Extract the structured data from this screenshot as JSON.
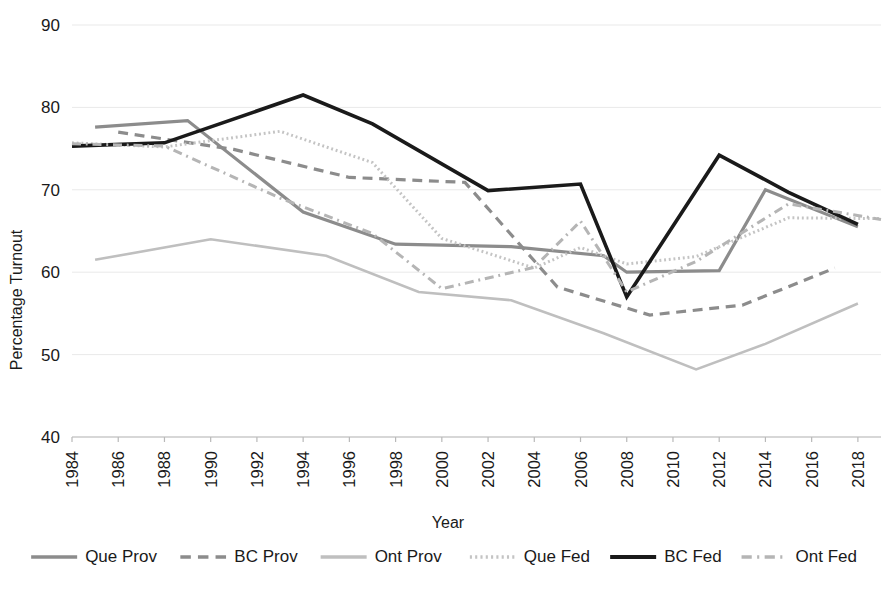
{
  "chart_data": {
    "type": "line",
    "title": "",
    "xlabel": "Year",
    "ylabel": "Percentage Turnout",
    "xlim": [
      1984,
      2019
    ],
    "ylim": [
      40,
      90
    ],
    "ytick_values": [
      40,
      50,
      60,
      70,
      80,
      90
    ],
    "xtick_values": [
      1984,
      1986,
      1988,
      1990,
      1992,
      1994,
      1996,
      1998,
      2000,
      2002,
      2004,
      2006,
      2008,
      2010,
      2012,
      2014,
      2016,
      2018
    ],
    "xtick_labels": [
      "1984",
      "1986",
      "1988",
      "1990",
      "1992",
      "1994",
      "1996",
      "1998",
      "2000",
      "2002",
      "2004",
      "2006",
      "2008",
      "2010",
      "2012",
      "2014",
      "2016",
      "2018"
    ],
    "ytick_labels": [
      "40",
      "50",
      "60",
      "70",
      "80",
      "90"
    ],
    "grid": true,
    "legend_position": "bottom",
    "series": [
      {
        "name": "Que Prov",
        "style": "solid",
        "color": "#8c8c8c",
        "width": 3.2,
        "points": [
          [
            1985,
            77.6
          ],
          [
            1989,
            78.4
          ],
          [
            1994,
            67.3
          ],
          [
            1998,
            63.4
          ],
          [
            2003,
            63.1
          ],
          [
            2007,
            62.0
          ],
          [
            2008,
            60.0
          ],
          [
            2012,
            60.2
          ],
          [
            2014,
            70.0
          ],
          [
            2018,
            65.5
          ]
        ]
      },
      {
        "name": "BC Prov",
        "style": "dashed",
        "color": "#8c8c8c",
        "width": 3.2,
        "points": [
          [
            1986,
            77.0
          ],
          [
            1991,
            74.9
          ],
          [
            1996,
            71.5
          ],
          [
            2001,
            70.9
          ],
          [
            2005,
            58.2
          ],
          [
            2009,
            54.8
          ],
          [
            2013,
            56.0
          ],
          [
            2017,
            60.5
          ]
        ]
      },
      {
        "name": "Ont Prov",
        "style": "solid",
        "color": "#bfbfbf",
        "width": 2.6,
        "points": [
          [
            1985,
            61.5
          ],
          [
            1990,
            64.0
          ],
          [
            1995,
            62.0
          ],
          [
            1999,
            57.6
          ],
          [
            2003,
            56.6
          ],
          [
            2007,
            52.6
          ],
          [
            2011,
            48.2
          ],
          [
            2014,
            51.3
          ],
          [
            2018,
            56.2
          ]
        ]
      },
      {
        "name": "Que Fed",
        "style": "dotted",
        "color": "#c4c4c4",
        "width": 3.0,
        "points": [
          [
            1984,
            75.7
          ],
          [
            1988,
            75.2
          ],
          [
            1993,
            77.1
          ],
          [
            1997,
            73.3
          ],
          [
            2000,
            64.1
          ],
          [
            2004,
            60.5
          ],
          [
            2006,
            63.0
          ],
          [
            2008,
            61.0
          ],
          [
            2011,
            61.9
          ],
          [
            2015,
            66.6
          ],
          [
            2019,
            66.5
          ]
        ]
      },
      {
        "name": "BC Fed",
        "style": "solid",
        "color": "#1a1a1a",
        "width": 3.6,
        "points": [
          [
            1984,
            75.3
          ],
          [
            1988,
            75.7
          ],
          [
            1994,
            81.5
          ],
          [
            1997,
            78.0
          ],
          [
            2002,
            69.9
          ],
          [
            2006,
            70.7
          ],
          [
            2008,
            57.0
          ],
          [
            2012,
            74.2
          ],
          [
            2015,
            69.7
          ],
          [
            2018,
            65.8
          ]
        ]
      },
      {
        "name": "Ont Fed",
        "style": "dashdot",
        "color": "#b5b5b5",
        "width": 3.0,
        "points": [
          [
            1984,
            75.6
          ],
          [
            1988,
            75.3
          ],
          [
            1993,
            69.0
          ],
          [
            1997,
            64.7
          ],
          [
            2000,
            58.0
          ],
          [
            2004,
            60.6
          ],
          [
            2006,
            66.2
          ],
          [
            2008,
            57.6
          ],
          [
            2011,
            61.3
          ],
          [
            2015,
            68.3
          ],
          [
            2019,
            66.4
          ]
        ]
      }
    ],
    "legend_entries": [
      {
        "label": "Que Prov",
        "style": "solid",
        "color": "#8c8c8c",
        "width": 3.4
      },
      {
        "label": "BC Prov",
        "style": "dashed",
        "color": "#8c8c8c",
        "width": 3.4
      },
      {
        "label": "Ont Prov",
        "style": "solid",
        "color": "#bfbfbf",
        "width": 3.4
      },
      {
        "label": "Que Fed",
        "style": "dotted",
        "color": "#c4c4c4",
        "width": 3.4
      },
      {
        "label": "BC Fed",
        "style": "solid",
        "color": "#1a1a1a",
        "width": 4.2
      },
      {
        "label": "Ont Fed",
        "style": "dashdot",
        "color": "#b5b5b5",
        "width": 3.4
      }
    ]
  }
}
